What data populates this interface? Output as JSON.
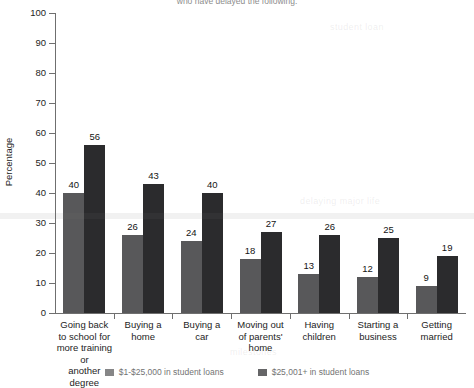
{
  "chart_data": {
    "type": "bar",
    "title": "who have delayed the following:",
    "xlabel": "",
    "ylabel": "Percentage",
    "ylim": [
      0,
      100
    ],
    "yticks": [
      0,
      10,
      20,
      30,
      40,
      50,
      60,
      70,
      80,
      90,
      100
    ],
    "grid": false,
    "legend_position": "bottom",
    "categories": [
      "Going back to school for more training or another degree",
      "Buying a home",
      "Buying a car",
      "Moving out of parents' home",
      "Having children",
      "Starting a business",
      "Getting married"
    ],
    "category_lines": [
      [
        "Going back",
        "to school for",
        "more training or",
        "another degree"
      ],
      [
        "Buying a",
        "home"
      ],
      [
        "Buying a",
        "car"
      ],
      [
        "Moving out",
        "of parents'",
        "home"
      ],
      [
        "Having",
        "children"
      ],
      [
        "Starting a",
        "business"
      ],
      [
        "Getting",
        "married"
      ]
    ],
    "series": [
      {
        "name": "$1-$25,000 in student loans",
        "color": "#58585a",
        "values": [
          40,
          26,
          24,
          18,
          13,
          12,
          9
        ]
      },
      {
        "name": "$25,001+ in student loans",
        "color": "#2b2b2d",
        "values": [
          56,
          43,
          40,
          27,
          26,
          25,
          19
        ]
      }
    ]
  },
  "ghost_text": {
    "line1": "student loan",
    "line2": "delaying major life",
    "line3": "milestones"
  }
}
